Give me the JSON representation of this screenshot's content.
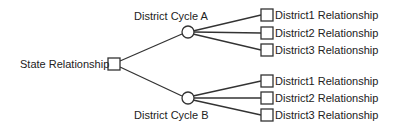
{
  "diagram": {
    "type": "tree",
    "root": {
      "label": "State Relationship",
      "shape": "square"
    },
    "cycles": [
      {
        "label": "District Cycle A",
        "shape": "circle",
        "children": [
          {
            "label": "District1 Relationship",
            "shape": "square"
          },
          {
            "label": "District2 Relationship",
            "shape": "square"
          },
          {
            "label": "District3 Relationship",
            "shape": "square"
          }
        ]
      },
      {
        "label": "District Cycle B",
        "shape": "circle",
        "children": [
          {
            "label": "District1 Relationship",
            "shape": "square"
          },
          {
            "label": "District2 Relationship",
            "shape": "square"
          },
          {
            "label": "District3 Relationship",
            "shape": "square"
          }
        ]
      }
    ],
    "colors": {
      "stroke": "#333333",
      "text": "#222222",
      "background": "#ffffff"
    }
  }
}
